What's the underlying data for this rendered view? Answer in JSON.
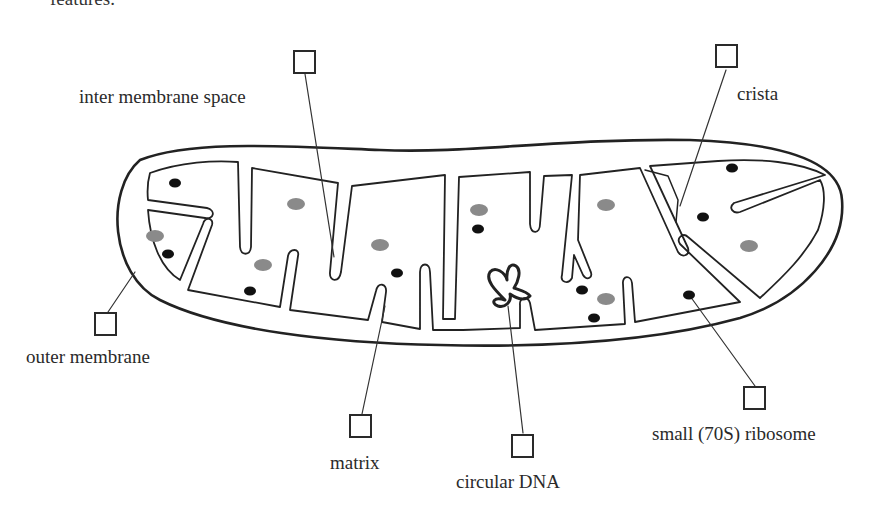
{
  "header": {
    "cut_text": "features."
  },
  "diagram": {
    "colors": {
      "outline": "#222222",
      "ribosome": "#111111",
      "granule": "#8a8a8a"
    },
    "labels": [
      {
        "id": "inter-membrane-space",
        "text": "inter membrane space"
      },
      {
        "id": "crista",
        "text": "crista"
      },
      {
        "id": "outer-membrane",
        "text": "outer membrane"
      },
      {
        "id": "matrix",
        "text": "matrix"
      },
      {
        "id": "circular-dna",
        "text": "circular DNA"
      },
      {
        "id": "small-ribosome",
        "text": "small (70S) ribosome"
      }
    ]
  }
}
